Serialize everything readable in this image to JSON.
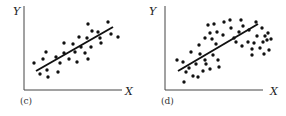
{
  "chart_data": [
    {
      "type": "scatter",
      "panel_label": "(c)",
      "xlabel": "X",
      "ylabel": "Y",
      "grid": false,
      "description": "Linear positive relationship with fitted regression line",
      "axis_origin_px": [
        24,
        90
      ],
      "points_px": [
        [
          34,
          63
        ],
        [
          40,
          74
        ],
        [
          43,
          59
        ],
        [
          46,
          52
        ],
        [
          47,
          70
        ],
        [
          48,
          77
        ],
        [
          56,
          57
        ],
        [
          58,
          72
        ],
        [
          60,
          63
        ],
        [
          64,
          43
        ],
        [
          64,
          53
        ],
        [
          69,
          59
        ],
        [
          73,
          44
        ],
        [
          75,
          52
        ],
        [
          77,
          62
        ],
        [
          79,
          37
        ],
        [
          81,
          47
        ],
        [
          85,
          53
        ],
        [
          87,
          38
        ],
        [
          88,
          24
        ],
        [
          88,
          59
        ],
        [
          91,
          47
        ],
        [
          92,
          31
        ],
        [
          98,
          32
        ],
        [
          100,
          38
        ],
        [
          101,
          43
        ],
        [
          108,
          22
        ],
        [
          111,
          34
        ],
        [
          118,
          37
        ]
      ],
      "fit_line_px": [
        [
          36,
          71
        ],
        [
          113,
          27
        ]
      ]
    },
    {
      "type": "scatter",
      "panel_label": "(d)",
      "xlabel": "X",
      "ylabel": "Y",
      "grid": false,
      "description": "Curvilinear (inverted-U) relationship with straight regression line fitted",
      "axis_origin_px": [
        165,
        90
      ],
      "points_px": [
        [
          177,
          60
        ],
        [
          183,
          62
        ],
        [
          186,
          72
        ],
        [
          184,
          82
        ],
        [
          189,
          68
        ],
        [
          191,
          52
        ],
        [
          193,
          76
        ],
        [
          196,
          64
        ],
        [
          198,
          77
        ],
        [
          199,
          45
        ],
        [
          200,
          54
        ],
        [
          203,
          71
        ],
        [
          205,
          60
        ],
        [
          205,
          38
        ],
        [
          206,
          64
        ],
        [
          208,
          25
        ],
        [
          210,
          33
        ],
        [
          210,
          69
        ],
        [
          212,
          39
        ],
        [
          213,
          55
        ],
        [
          216,
          44
        ],
        [
          214,
          24
        ],
        [
          217,
          32
        ],
        [
          218,
          60
        ],
        [
          219,
          67
        ],
        [
          223,
          35
        ],
        [
          224,
          22
        ],
        [
          230,
          20
        ],
        [
          231,
          28
        ],
        [
          234,
          38
        ],
        [
          236,
          42
        ],
        [
          239,
          32
        ],
        [
          241,
          20
        ],
        [
          242,
          46
        ],
        [
          243,
          26
        ],
        [
          248,
          42
        ],
        [
          249,
          30
        ],
        [
          252,
          49
        ],
        [
          252,
          55
        ],
        [
          254,
          43
        ],
        [
          256,
          22
        ],
        [
          257,
          36
        ],
        [
          260,
          48
        ],
        [
          262,
          28
        ],
        [
          263,
          42
        ],
        [
          264,
          54
        ],
        [
          265,
          36
        ],
        [
          267,
          40
        ],
        [
          268,
          33
        ],
        [
          269,
          50
        ],
        [
          271,
          39
        ]
      ],
      "fit_line_px": [
        [
          178,
          71
        ],
        [
          258,
          24
        ]
      ]
    }
  ],
  "panels": [
    {
      "label": "(c)",
      "x_axis_label": "X",
      "y_axis_label": "Y"
    },
    {
      "label": "(d)",
      "x_axis_label": "X",
      "y_axis_label": "Y"
    }
  ]
}
